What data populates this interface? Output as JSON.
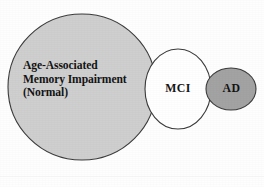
{
  "figure": {
    "type": "venn-continuum-diagram",
    "background_color": "#fefefe",
    "outline_color": "#3b3b3b",
    "caption": ""
  },
  "shapes": [
    {
      "id": "aami",
      "label": "Age-Associated\nMemory Impairment\n(Normal)",
      "label_lines": [
        "Age-Associated",
        "Memory Impairment",
        "(Normal)"
      ],
      "fill_color": "#cfcfcf",
      "stroke_color": "#3b3b3b",
      "shape": "circle",
      "cx": 82,
      "cy": 87,
      "rx": 74,
      "ry": 73
    },
    {
      "id": "mci",
      "label": "MCI",
      "fill_color": "#ffffff",
      "stroke_color": "#3b3b3b",
      "shape": "circle",
      "cx": 178,
      "cy": 89,
      "rx": 33,
      "ry": 40
    },
    {
      "id": "ad",
      "label": "AD",
      "fill_color": "#a3a3a3",
      "stroke_color": "#3b3b3b",
      "shape": "ellipse",
      "cx": 231,
      "cy": 89,
      "rx": 25,
      "ry": 21
    }
  ],
  "labels": {
    "aami": "Age-Associated\nMemory Impairment\n(Normal)",
    "mci": "MCI",
    "ad": "AD"
  }
}
